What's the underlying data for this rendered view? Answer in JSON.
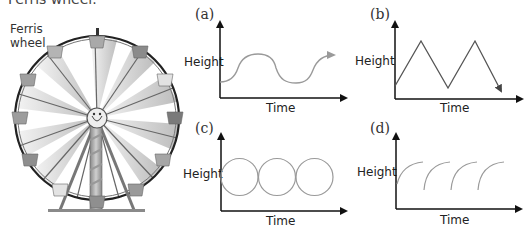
{
  "caption_top": "Ferris wheel.",
  "wheel": {
    "label_line1": "Ferris",
    "label_line2": "wheel"
  },
  "panels": [
    {
      "id": "a",
      "label": "(a)",
      "ylabel": "Height",
      "xlabel": "Time",
      "curve": "smooth sinusoidal wave with arrow"
    },
    {
      "id": "b",
      "label": "(b)",
      "ylabel": "Height",
      "xlabel": "Time",
      "curve": "triangular zig-zag with arrow"
    },
    {
      "id": "c",
      "label": "(c)",
      "ylabel": "Height",
      "xlabel": "Time",
      "curve": "three tangent circles"
    },
    {
      "id": "d",
      "label": "(d)",
      "ylabel": "Height",
      "xlabel": "Time",
      "curve": "repeating concave-down arcs"
    }
  ],
  "colors": {
    "axis": "#111111",
    "curve": "#9a9a9a",
    "zigzag": "#555555",
    "text": "#333333"
  }
}
